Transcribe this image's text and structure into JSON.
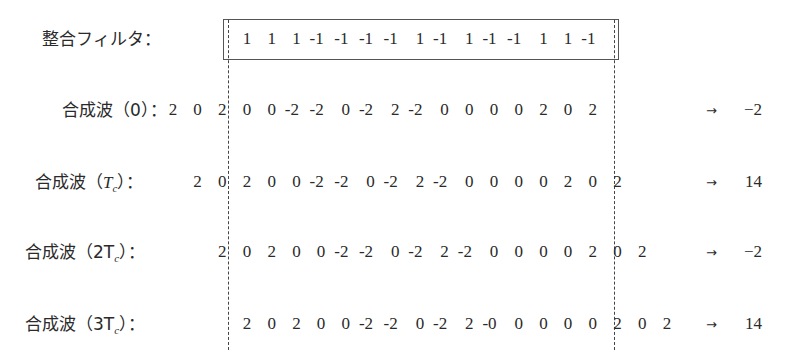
{
  "filter": {
    "label": "整合フィルタ：",
    "values": [
      "1",
      "1",
      "1",
      "-1",
      "-1",
      "-1",
      "-1",
      "1",
      "-1",
      "1",
      "-1",
      "-1",
      "1",
      "1",
      "-1"
    ],
    "start_index": 0
  },
  "rows": [
    {
      "label_prefix": "合成波（0）：",
      "values": [
        "2",
        "0",
        "2",
        "0",
        "0",
        "-2",
        "-2",
        "0",
        "-2",
        "2",
        "-2",
        "0",
        "0",
        "0",
        "0",
        "2",
        "0",
        "2"
      ],
      "start_index": -3,
      "arrow": "→",
      "result": "−2"
    },
    {
      "label_prefix": "合成波（",
      "label_var": "T",
      "label_sub": "c",
      "label_suffix": "）：",
      "values": [
        "2",
        "0",
        "2",
        "0",
        "0",
        "-2",
        "-2",
        "0",
        "-2",
        "2",
        "-2",
        "0",
        "0",
        "0",
        "0",
        "2",
        "0",
        "2"
      ],
      "start_index": -2,
      "arrow": "→",
      "result": "14"
    },
    {
      "label_prefix": "合成波（2T",
      "label_sub": "c",
      "label_suffix": "）：",
      "values": [
        "2",
        "0",
        "2",
        "0",
        "0",
        "-2",
        "-2",
        "0",
        "-2",
        "2",
        "-2",
        "0",
        "0",
        "0",
        "0",
        "2",
        "0",
        "2"
      ],
      "start_index": -1,
      "arrow": "→",
      "result": "−2"
    },
    {
      "label_prefix": "合成波（3T",
      "label_sub": "c",
      "label_suffix": "）：",
      "values": [
        "2",
        "0",
        "2",
        "0",
        "0",
        "-2",
        "-2",
        "0",
        "-2",
        "2",
        "-0",
        "0",
        "0",
        "0",
        "0",
        "2",
        "0",
        "2"
      ],
      "start_index": 0,
      "arrow": "→",
      "result": "14"
    }
  ],
  "layout": {
    "cell_origin_x": 235,
    "cell_pitch": 24.7,
    "filter_y": 29,
    "row_y": [
      100,
      172,
      242,
      314
    ],
    "label_x": [
      42,
      50,
      20,
      20
    ],
    "dash_x": [
      228,
      614
    ]
  }
}
